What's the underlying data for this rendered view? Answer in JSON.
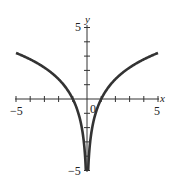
{
  "chart_data": {
    "type": "line",
    "title": "",
    "xlabel": "x",
    "ylabel": "y",
    "xlim": [
      -5,
      5
    ],
    "ylim": [
      -5,
      5
    ],
    "grid": false,
    "legend": null,
    "x_tick_labels": [
      "-5",
      "0",
      "5"
    ],
    "y_tick_labels": [
      "5",
      "-5"
    ],
    "x_ticks": [
      -5,
      -4,
      -3,
      -2,
      -1,
      0,
      1,
      2,
      3,
      4,
      5
    ],
    "y_ticks": [
      -5,
      -4,
      -3,
      -2,
      -1,
      0,
      1,
      2,
      3,
      4,
      5
    ],
    "series": [
      {
        "name": "y = 2 ln|x|",
        "color": "#333333",
        "x": [
          -5,
          -4,
          -3,
          -2,
          -1.5,
          -1,
          -0.7,
          -0.5,
          -0.3,
          -0.1,
          0.1,
          0.3,
          0.5,
          0.7,
          1,
          1.5,
          2,
          3,
          4,
          5
        ],
        "y": [
          3.22,
          2.77,
          2.2,
          1.39,
          0.81,
          0,
          -0.71,
          -1.39,
          -2.41,
          -4.6,
          -4.6,
          -2.41,
          -1.39,
          -0.71,
          0,
          0.81,
          1.39,
          2.2,
          2.77,
          3.22
        ]
      }
    ]
  },
  "labels": {
    "x_axis": "x",
    "y_axis": "y",
    "x_min": "−5",
    "x_max": "5",
    "origin": "0",
    "y_max": "5",
    "y_min": "−5"
  }
}
